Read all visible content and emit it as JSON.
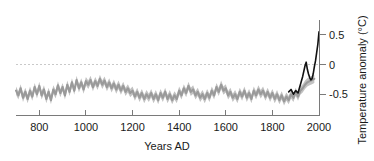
{
  "chart_data": {
    "type": "line",
    "title": "",
    "xlabel": "Years AD",
    "ylabel": "Temperature anomaly (°C)",
    "xlim": [
      700,
      2000
    ],
    "ylim": [
      -0.85,
      0.75
    ],
    "xticks": [
      800,
      1000,
      1200,
      1400,
      1600,
      1800,
      2000
    ],
    "xtick_labels": [
      "800",
      "1000",
      "1200",
      "1400",
      "1600",
      "1800",
      "2000"
    ],
    "yticks": [
      0.5,
      0,
      -0.5
    ],
    "ytick_labels": [
      "0.5",
      "0",
      "-0.5"
    ],
    "grid": false,
    "legend": "none",
    "annotations": [
      {
        "name": "zero-reference-line",
        "y": 0,
        "style": "dashed",
        "color": "#c9c9c9"
      }
    ],
    "colors": {
      "proxy": "#9a9a9a",
      "proxy_band": "#c2c2c2",
      "instrumental": "#111111",
      "axis": "#7a7a7a",
      "zero_line": "#c9c9c9",
      "text": "#1a1a1a",
      "background": "#ffffff"
    },
    "series": [
      {
        "name": "Proxy reconstruction",
        "color": "#9a9a9a",
        "x": [
          700,
          710,
          720,
          730,
          740,
          750,
          760,
          770,
          780,
          790,
          800,
          810,
          820,
          830,
          840,
          850,
          860,
          870,
          880,
          890,
          900,
          910,
          920,
          930,
          940,
          950,
          960,
          970,
          980,
          990,
          1000,
          1010,
          1020,
          1030,
          1040,
          1050,
          1060,
          1070,
          1080,
          1090,
          1100,
          1110,
          1120,
          1130,
          1140,
          1150,
          1160,
          1170,
          1180,
          1190,
          1200,
          1210,
          1220,
          1230,
          1240,
          1250,
          1260,
          1270,
          1280,
          1290,
          1300,
          1310,
          1320,
          1330,
          1340,
          1350,
          1360,
          1370,
          1380,
          1390,
          1400,
          1410,
          1420,
          1430,
          1440,
          1450,
          1460,
          1470,
          1480,
          1490,
          1500,
          1510,
          1520,
          1530,
          1540,
          1550,
          1560,
          1570,
          1580,
          1590,
          1600,
          1610,
          1620,
          1630,
          1640,
          1650,
          1660,
          1670,
          1680,
          1690,
          1700,
          1710,
          1720,
          1730,
          1740,
          1750,
          1760,
          1770,
          1780,
          1790,
          1800,
          1810,
          1820,
          1830,
          1840,
          1850,
          1860,
          1870,
          1880,
          1890,
          1900,
          1910,
          1920,
          1930,
          1940,
          1950,
          1960,
          1970,
          1980
        ],
        "values": [
          -0.44,
          -0.52,
          -0.4,
          -0.56,
          -0.46,
          -0.58,
          -0.44,
          -0.54,
          -0.38,
          -0.5,
          -0.36,
          -0.52,
          -0.42,
          -0.58,
          -0.46,
          -0.6,
          -0.42,
          -0.5,
          -0.35,
          -0.48,
          -0.38,
          -0.52,
          -0.34,
          -0.46,
          -0.3,
          -0.44,
          -0.26,
          -0.4,
          -0.3,
          -0.42,
          -0.28,
          -0.34,
          -0.26,
          -0.38,
          -0.28,
          -0.36,
          -0.24,
          -0.34,
          -0.27,
          -0.38,
          -0.3,
          -0.4,
          -0.32,
          -0.42,
          -0.34,
          -0.44,
          -0.36,
          -0.46,
          -0.4,
          -0.48,
          -0.44,
          -0.54,
          -0.46,
          -0.56,
          -0.48,
          -0.58,
          -0.5,
          -0.56,
          -0.48,
          -0.58,
          -0.5,
          -0.6,
          -0.48,
          -0.56,
          -0.46,
          -0.58,
          -0.5,
          -0.6,
          -0.52,
          -0.58,
          -0.44,
          -0.52,
          -0.4,
          -0.48,
          -0.36,
          -0.46,
          -0.42,
          -0.52,
          -0.46,
          -0.56,
          -0.5,
          -0.58,
          -0.48,
          -0.56,
          -0.44,
          -0.52,
          -0.38,
          -0.46,
          -0.34,
          -0.44,
          -0.4,
          -0.52,
          -0.46,
          -0.56,
          -0.5,
          -0.58,
          -0.46,
          -0.54,
          -0.44,
          -0.56,
          -0.48,
          -0.58,
          -0.44,
          -0.52,
          -0.42,
          -0.5,
          -0.44,
          -0.54,
          -0.46,
          -0.56,
          -0.48,
          -0.58,
          -0.5,
          -0.6,
          -0.52,
          -0.62,
          -0.54,
          -0.6,
          -0.5,
          -0.56,
          -0.46,
          -0.54,
          -0.44,
          -0.4,
          -0.34,
          -0.3,
          -0.28,
          -0.26,
          -0.24
        ],
        "band_half_width": 0.07
      },
      {
        "name": "Instrumental record",
        "color": "#111111",
        "x": [
          1870,
          1880,
          1890,
          1900,
          1910,
          1920,
          1930,
          1940,
          1945,
          1950,
          1955,
          1960,
          1965,
          1970,
          1975,
          1980,
          1985,
          1990,
          1995,
          2000
        ],
        "values": [
          -0.46,
          -0.42,
          -0.5,
          -0.44,
          -0.48,
          -0.34,
          -0.2,
          -0.02,
          0.04,
          -0.08,
          -0.16,
          -0.22,
          -0.26,
          -0.24,
          -0.16,
          -0.04,
          0.06,
          0.2,
          0.34,
          0.55
        ]
      }
    ]
  }
}
